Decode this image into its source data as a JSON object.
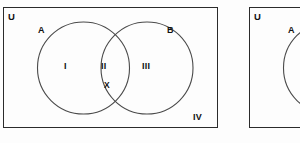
{
  "figures": [
    {
      "id": "venn-complete",
      "universe_label": "U",
      "sets": [
        {
          "name": "A",
          "label": "A"
        },
        {
          "name": "B",
          "label": "B"
        }
      ],
      "regions": [
        {
          "name": "A-only",
          "label": "I"
        },
        {
          "name": "A-and-B",
          "label": "II"
        },
        {
          "name": "B-only",
          "label": "III"
        },
        {
          "name": "outside-A-and-B",
          "label": "IV"
        }
      ],
      "elements": [
        {
          "name": "element-x",
          "label": "X",
          "region": "A-and-B"
        }
      ]
    },
    {
      "id": "venn-partial",
      "universe_label": "U",
      "sets": [
        {
          "name": "A",
          "label": "A"
        }
      ],
      "regions": [],
      "elements": []
    }
  ],
  "colors": {
    "stroke": "#2b2b2b",
    "circle_stroke": "#4a4a4a",
    "text": "#111111",
    "background": "#fdfdfd"
  }
}
